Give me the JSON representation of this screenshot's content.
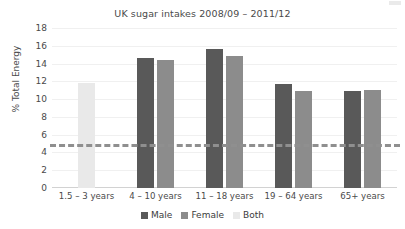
{
  "chart_data": {
    "type": "bar",
    "title": "UK sugar intakes 2008/09 – 2011/12",
    "xlabel": "",
    "ylabel": "% Total Energy",
    "ylim": [
      0,
      18
    ],
    "ytick_step": 2,
    "yticks": [
      18,
      16,
      14,
      12,
      10,
      8,
      6,
      4,
      2,
      0
    ],
    "grid": true,
    "legend_position": "bottom",
    "categories": [
      "1.5 – 3 years",
      "4 – 10 years",
      "11 – 18 years",
      "19 – 64 years",
      "65+ years"
    ],
    "series": [
      {
        "name": "Male",
        "color": "#595959",
        "values": [
          null,
          14.6,
          15.6,
          11.7,
          10.9
        ]
      },
      {
        "name": "Female",
        "color": "#8c8c8c",
        "values": [
          null,
          14.4,
          14.8,
          10.9,
          11.0
        ]
      },
      {
        "name": "Both",
        "color": "#e9e9e9",
        "values": [
          11.8,
          null,
          null,
          null,
          null
        ]
      }
    ],
    "reference_line": {
      "value": 5,
      "style": "dashed",
      "color": "#8f8f8f"
    }
  }
}
